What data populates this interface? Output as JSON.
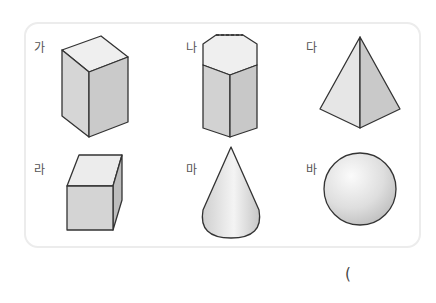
{
  "figure": {
    "shapes": [
      {
        "id": "ga",
        "label": "가",
        "shape": "square-prism"
      },
      {
        "id": "na",
        "label": "나",
        "shape": "hexagonal-prism"
      },
      {
        "id": "da",
        "label": "다",
        "shape": "triangular-pyramid"
      },
      {
        "id": "ra",
        "label": "라",
        "shape": "cube"
      },
      {
        "id": "ma",
        "label": "마",
        "shape": "cone"
      },
      {
        "id": "ba",
        "label": "바",
        "shape": "sphere"
      }
    ]
  },
  "answer": {
    "open_paren": "("
  },
  "colors": {
    "stroke": "#333333",
    "face_light": "#ececec",
    "face_mid": "#dcdcdc",
    "face_dark": "#c8c8c8",
    "panel_border": "#ececec"
  }
}
